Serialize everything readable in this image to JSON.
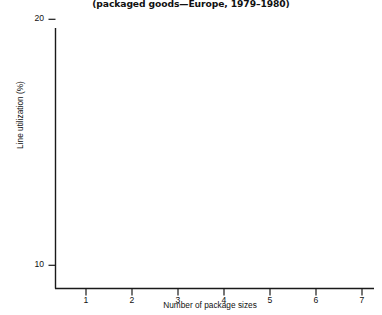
{
  "figure": {
    "subtitle": "(packaged goods—Europe, 1979–1980)"
  },
  "chart_data": {
    "type": "scatter",
    "title": "",
    "subtitle": "(packaged goods—Europe, 1979–1980)",
    "xlabel": "Number of package sizes",
    "ylabel": "Line utilization (%)",
    "xlim": [
      0,
      7.35
    ],
    "ylim": [
      0,
      107
    ],
    "xticks": [
      1,
      2,
      3,
      4,
      5,
      6,
      7
    ],
    "xtick_labels": [
      "1",
      "2",
      "3",
      "4",
      "5",
      "6",
      "7"
    ],
    "yticks": [
      10,
      20,
      30,
      40,
      50,
      60,
      70,
      80,
      90,
      100
    ],
    "ytick_labels": [
      "10",
      "20",
      "30",
      "40",
      "50",
      "60",
      "70",
      "80",
      "90",
      "100"
    ],
    "grid": false,
    "legend": null,
    "marker": "x",
    "marker_color": "#222222",
    "line_color": "#1a1a1a",
    "series": [
      {
        "name": "observations",
        "points": [
          {
            "x": 1.08,
            "y": 97
          },
          {
            "x": 0.86,
            "y": 88
          },
          {
            "x": 2.02,
            "y": 65.5
          },
          {
            "x": 3.02,
            "y": 84
          },
          {
            "x": 2.98,
            "y": 63.5
          },
          {
            "x": 4.02,
            "y": 64
          },
          {
            "x": 4.0,
            "y": 53
          },
          {
            "x": 3.97,
            "y": 45.5
          },
          {
            "x": 7.0,
            "y": 28
          }
        ]
      }
    ],
    "trend_line": {
      "name": "fitted regression line",
      "x_start": 0.72,
      "y_start": 101,
      "x_end": 7.02,
      "y_end": 29.5
    }
  }
}
